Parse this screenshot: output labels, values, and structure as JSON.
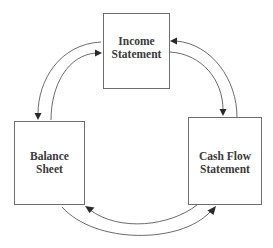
{
  "diagram": {
    "type": "cycle",
    "nodes": {
      "income": {
        "line1": "Income",
        "line2": "Statement"
      },
      "balance": {
        "line1": "Balance",
        "line2": "Sheet"
      },
      "cashflow": {
        "line1": "Cash Flow",
        "line2": "Statement"
      }
    },
    "edges": [
      {
        "from": "Income Statement",
        "to": "Balance Sheet"
      },
      {
        "from": "Balance Sheet",
        "to": "Income Statement"
      },
      {
        "from": "Income Statement",
        "to": "Cash Flow Statement"
      },
      {
        "from": "Cash Flow Statement",
        "to": "Income Statement"
      },
      {
        "from": "Balance Sheet",
        "to": "Cash Flow Statement"
      },
      {
        "from": "Cash Flow Statement",
        "to": "Balance Sheet"
      }
    ],
    "colors": {
      "border": "#6e6e6e",
      "arrow": "#5a5a5a",
      "text": "#3a3a3a"
    }
  }
}
